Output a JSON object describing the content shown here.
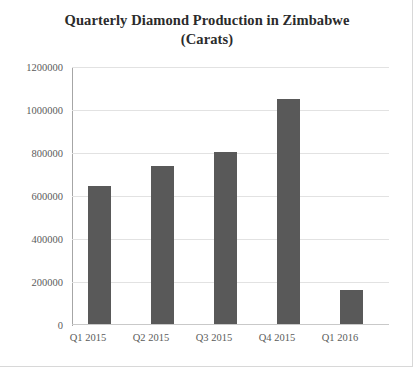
{
  "chart_data": {
    "type": "bar",
    "title": "Quarterly Diamond Production in Zimbabwe (Carats)",
    "title_line_1": "Quarterly Diamond Production in Zimbabwe",
    "title_line_2": "(Carats)",
    "xlabel": "",
    "ylabel": "",
    "categories": [
      "Q1 2015",
      "Q2 2015",
      "Q3 2015",
      "Q4 2015",
      "Q1 2016"
    ],
    "values": [
      645000,
      740000,
      805000,
      1050000,
      160000
    ],
    "series": [
      {
        "name": "Carats",
        "values": [
          645000,
          740000,
          805000,
          1050000,
          160000
        ]
      }
    ],
    "ylim": [
      0,
      1200000
    ],
    "ytick_values": [
      0,
      200000,
      400000,
      600000,
      800000,
      1000000,
      1200000
    ],
    "ytick_labels": [
      "0",
      "200000",
      "400000",
      "600000",
      "800000",
      "1000000",
      "1200000"
    ],
    "grid": true,
    "grid_axis": "y",
    "legend": false,
    "legend_position": "none",
    "bar_color": "#595959",
    "gridline_color": "#e2e2e2",
    "axis_color": "#a6a6a6",
    "background_color": "#ffffff",
    "text_color": "#5b5b5b",
    "title_color": "#2b2b2b"
  }
}
